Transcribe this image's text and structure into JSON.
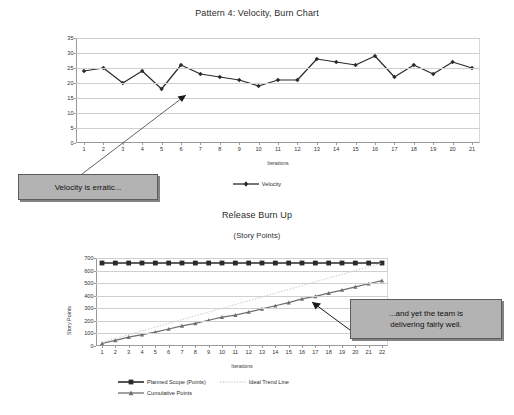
{
  "velocity_chart": {
    "title": "Pattern 4: Velocity, Burn Chart",
    "xlabel": "Iterations",
    "legend_label": "Velocity",
    "callout": "Velocity is erratic..."
  },
  "burnup_chart": {
    "title": "Release Burn Up",
    "subtitle": "(Story Points)",
    "xlabel": "Iterations",
    "ylabel": "Story Points",
    "legend": {
      "planned": "Planned Scope (Points)",
      "ideal": "Ideal Trend Line",
      "cumulative": "Cumulative Points"
    },
    "callout_line1": "...and yet the team is",
    "callout_line2": "delivering fairly well."
  },
  "colors": {
    "series_dark": "#2b2b2b",
    "series_mid": "#6e6e6e",
    "series_light": "#c8c8c8",
    "grid": "#cfcfcf",
    "axis": "#9a9a9a",
    "callout_bg": "#b3b3b3",
    "callout_border": "#5c5c5c"
  },
  "chart_data": [
    {
      "type": "line",
      "title": "Pattern 4: Velocity, Burn Chart",
      "xlabel": "Iterations",
      "ylabel": "",
      "categories": [
        1,
        2,
        3,
        4,
        5,
        6,
        7,
        8,
        9,
        10,
        11,
        12,
        13,
        14,
        15,
        16,
        17,
        18,
        19,
        20,
        21
      ],
      "xticklabels": [
        "1",
        "2",
        "3",
        "4",
        "5",
        "6",
        "7",
        "8",
        "9",
        "10",
        "11",
        "12",
        "13",
        "14",
        "15",
        "16",
        "17",
        "18",
        "19",
        "20",
        "21"
      ],
      "yticklabels": [
        "0",
        "5",
        "10",
        "15",
        "20",
        "25",
        "30",
        "35"
      ],
      "ylim": [
        0,
        35
      ],
      "ytick_step": 5,
      "grid": true,
      "legend_position": "bottom-center",
      "series": [
        {
          "name": "Velocity",
          "marker": "diamond",
          "color": "#2b2b2b",
          "values": [
            24,
            25,
            20,
            24,
            18,
            26,
            23,
            22,
            21,
            19,
            21,
            21,
            28,
            27,
            26,
            29,
            22,
            26,
            23,
            27,
            25
          ]
        }
      ],
      "annotations": [
        {
          "text": "Velocity is erratic...",
          "points_to_x": 8,
          "points_to_y": 17
        }
      ]
    },
    {
      "type": "line",
      "title": "Release Burn Up",
      "subtitle": "(Story Points)",
      "xlabel": "Iterations",
      "ylabel": "Story Points",
      "categories": [
        1,
        2,
        3,
        4,
        5,
        6,
        7,
        8,
        9,
        10,
        11,
        12,
        13,
        14,
        15,
        16,
        17,
        18,
        19,
        20,
        21,
        22
      ],
      "xticklabels": [
        "1",
        "2",
        "3",
        "4",
        "5",
        "6",
        "7",
        "8",
        "9",
        "10",
        "11",
        "12",
        "13",
        "14",
        "15",
        "16",
        "17",
        "18",
        "19",
        "20",
        "21",
        "22"
      ],
      "yticklabels": [
        "0",
        "100",
        "200",
        "300",
        "400",
        "500",
        "600",
        "700"
      ],
      "ylim": [
        0,
        700
      ],
      "ytick_step": 100,
      "grid": true,
      "legend_position": "bottom-center",
      "series": [
        {
          "name": "Planned Scope (Points)",
          "marker": "square",
          "color": "#2b2b2b",
          "values": [
            660,
            660,
            660,
            660,
            660,
            660,
            660,
            660,
            660,
            660,
            660,
            660,
            660,
            660,
            660,
            660,
            660,
            660,
            660,
            660,
            660,
            660
          ]
        },
        {
          "name": "Ideal Trend Line",
          "marker": "none",
          "style": "dotted",
          "color": "#c8c8c8",
          "values": [
            30,
            60,
            90,
            120,
            150,
            180,
            210,
            240,
            270,
            300,
            330,
            360,
            390,
            420,
            450,
            480,
            510,
            540,
            570,
            600,
            630,
            660
          ]
        },
        {
          "name": "Cumulative Points",
          "marker": "triangle",
          "color": "#6e6e6e",
          "values": [
            20,
            45,
            70,
            90,
            110,
            135,
            160,
            180,
            205,
            230,
            245,
            270,
            295,
            320,
            345,
            375,
            395,
            420,
            445,
            470,
            495,
            520
          ]
        }
      ],
      "annotations": [
        {
          "text": "...and yet the team is delivering fairly well.",
          "points_to_x": 16,
          "points_to_y": 340
        }
      ]
    }
  ]
}
